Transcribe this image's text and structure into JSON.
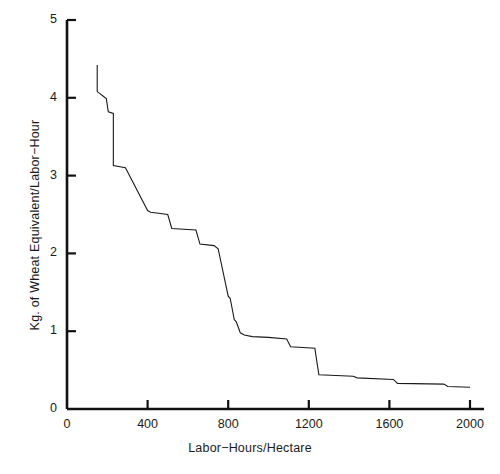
{
  "chart_data": {
    "type": "line",
    "subtype": "step-post",
    "title": "",
    "subtitle": "",
    "xlabel": "Labor−Hours/Hectare",
    "ylabel": "Kg. of Wheat Equivalent/Labor−Hour",
    "xlim": [
      0,
      2000
    ],
    "ylim": [
      0,
      5
    ],
    "xticks": [
      0,
      400,
      800,
      1200,
      1600,
      2000
    ],
    "yticks": [
      0,
      1,
      2,
      3,
      4,
      5
    ],
    "xtick_labels": [
      "0",
      "400",
      "800",
      "1200",
      "1600",
      "2000"
    ],
    "ytick_labels": [
      "0",
      "1",
      "2",
      "3",
      "4",
      "5"
    ],
    "grid": false,
    "legend": null,
    "legend_position": "none",
    "series": [
      {
        "name": "Wheat equivalent per labor-hour",
        "color": "#1a1a1a",
        "line_width": 1.1,
        "x": [
          150,
          150,
          165,
          180,
          195,
          205,
          230,
          230,
          290,
          400,
          415,
          500,
          520,
          640,
          660,
          730,
          750,
          800,
          810,
          830,
          840,
          860,
          880,
          920,
          1000,
          1090,
          1110,
          1230,
          1250,
          1420,
          1440,
          1620,
          1640,
          1870,
          1890,
          2000
        ],
        "y": [
          4.42,
          4.08,
          4.05,
          4.02,
          3.99,
          3.82,
          3.8,
          3.13,
          3.1,
          2.55,
          2.53,
          2.5,
          2.32,
          2.3,
          2.12,
          2.1,
          2.06,
          1.45,
          1.42,
          1.15,
          1.12,
          0.98,
          0.95,
          0.93,
          0.92,
          0.9,
          0.8,
          0.78,
          0.44,
          0.42,
          0.4,
          0.38,
          0.33,
          0.32,
          0.29,
          0.28
        ]
      }
    ]
  },
  "axes": {
    "x_axis_name": "Labor−Hours/Hectare",
    "y_axis_name": "Kg. of Wheat Equivalent/Labor−Hour"
  }
}
